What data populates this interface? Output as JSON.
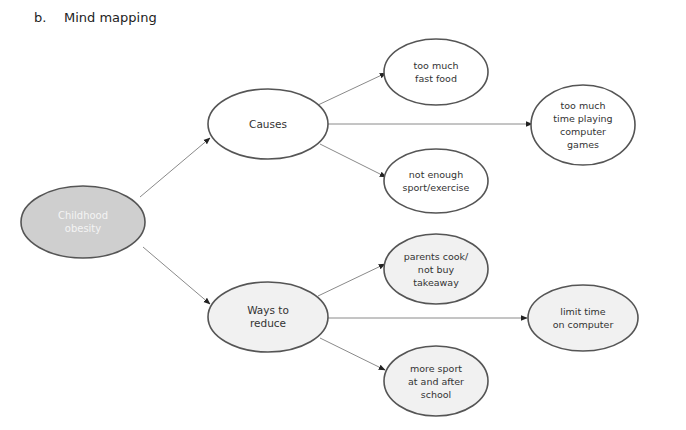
{
  "heading": {
    "marker": "b.",
    "title": "Mind mapping"
  },
  "colors": {
    "line": "#8a8a8a",
    "stroke": "#555555",
    "center_fill": "#cfcfcf",
    "light_fill": "#f1f1f1",
    "white_fill": "#ffffff"
  },
  "nodes": {
    "center": {
      "label": "Childhood\nobesity"
    },
    "causes": {
      "label": "Causes"
    },
    "fast_food": {
      "label": "too much\nfast food"
    },
    "computer_games": {
      "label": "too much\ntime playing\ncomputer\ngames"
    },
    "not_enough_sport": {
      "label": "not enough\nsport/exercise"
    },
    "ways_to_reduce": {
      "label": "Ways to\nreduce"
    },
    "parents_cook": {
      "label": "parents cook/\nnot buy\ntakeaway"
    },
    "limit_time": {
      "label": "limit time\non computer"
    },
    "more_sport": {
      "label": "more sport\nat and after\nschool"
    }
  }
}
